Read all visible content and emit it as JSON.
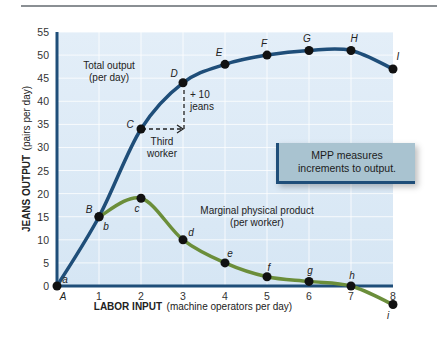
{
  "chart_data": {
    "type": "line",
    "title": "",
    "xlabel": "LABOR INPUT (machine operators per day)",
    "xlabel_bold": "LABOR INPUT",
    "xlabel_rest": "(machine operators per day)",
    "ylabel": "JEANS OUTPUT (pairs per day)",
    "ylabel_bold": "JEANS OUTPUT",
    "ylabel_rest": "(pairs per day)",
    "x_ticks": [
      "1",
      "2",
      "3",
      "4",
      "5",
      "6",
      "7",
      "8"
    ],
    "y_ticks": [
      "0",
      "5",
      "10",
      "15",
      "20",
      "25",
      "30",
      "35",
      "40",
      "45",
      "50",
      "55"
    ],
    "xlim": [
      0,
      8
    ],
    "ylim": [
      0,
      55
    ],
    "grid": true,
    "x": [
      0,
      1,
      2,
      3,
      4,
      5,
      6,
      7,
      8
    ],
    "series": [
      {
        "name": "Total output (per day)",
        "color": "#1f4e79",
        "point_labels": [
          "A",
          "B",
          "C",
          "D",
          "E",
          "F",
          "G",
          "H",
          "I"
        ],
        "values": [
          0,
          15,
          34,
          44,
          48,
          50,
          51,
          51,
          47
        ]
      },
      {
        "name": "Marginal physical product (per worker)",
        "color": "#6b8e3a",
        "point_labels": [
          "a",
          "b",
          "c",
          "d",
          "e",
          "f",
          "g",
          "h",
          "i"
        ],
        "values": [
          0,
          15,
          19,
          10,
          5,
          2,
          1,
          0,
          -4
        ]
      }
    ],
    "annotations": [
      {
        "text": "Total output",
        "text2": "(per day)"
      },
      {
        "text": "+ 10",
        "text2": "jeans"
      },
      {
        "text": "Third",
        "text2": "worker"
      },
      {
        "text": "Marginal physical product",
        "text2": "(per worker)"
      },
      {
        "text": "MPP measures",
        "text2": "increments to output."
      }
    ],
    "origin_label": "A"
  },
  "labels": {
    "total_output_1": "Total output",
    "total_output_2": "(per day)",
    "plus10_1": "+ 10",
    "plus10_2": "jeans",
    "third_1": "Third",
    "third_2": "worker",
    "mpp_1": "Marginal physical product",
    "mpp_2": "(per worker)",
    "callout_1": "MPP measures",
    "callout_2": "increments to output."
  }
}
